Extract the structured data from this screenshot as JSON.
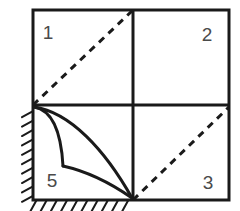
{
  "figure": {
    "canvas": {
      "width": 240,
      "height": 211
    },
    "background_color": "#ffffff",
    "stroke_color": "#1a1a1a",
    "label_color": "#4a4a4a",
    "frame": {
      "name": "outer-square-frame",
      "left": 33,
      "top": 10,
      "right": 229,
      "bottom": 200,
      "stroke_width": 3
    },
    "center": {
      "x": 133,
      "y": 105
    },
    "grid_lines": [
      {
        "name": "vertical-divider",
        "x1": 133,
        "y1": 10,
        "x2": 133,
        "y2": 200,
        "stroke_width": 3
      },
      {
        "name": "horizontal-divider",
        "x1": 33,
        "y1": 105,
        "x2": 229,
        "y2": 105,
        "stroke_width": 3
      }
    ],
    "dashed_diagonals": [
      {
        "name": "dashed-diagonal-upper-left",
        "x1": 33,
        "y1": 105,
        "x2": 133,
        "y2": 10,
        "stroke_width": 3,
        "dash_pattern": "7 6"
      },
      {
        "name": "dashed-diagonal-lower-right",
        "x1": 133,
        "y1": 200,
        "x2": 229,
        "y2": 107,
        "stroke_width": 3,
        "dash_pattern": "7 6"
      }
    ],
    "curves": [
      {
        "name": "outer-curve",
        "description": "Shallow concave curve from corner node to bottom node",
        "path": "M 34 107 C 70 112 105 150 132 198",
        "stroke_width": 3
      },
      {
        "name": "inner-curve-upper-segment",
        "description": "Steep curve from corner node bending down to kink",
        "path": "M 34 107 C 52 110 61 130 63 166",
        "stroke_width": 3
      },
      {
        "name": "inner-curve-lower-segment",
        "description": "Curve from kink sweeping right to bottom node",
        "path": "M 63 166 C 90 172 112 184 132 198",
        "stroke_width": 3
      }
    ],
    "hatching": {
      "name": "fixed-support-hatching",
      "left_edge": {
        "name": "left-edge-hatching",
        "x": 33,
        "y_start": 106,
        "y_end": 200,
        "count": 10,
        "length": 11,
        "stroke_width": 2
      },
      "bottom_edge": {
        "name": "bottom-edge-hatching",
        "y": 200,
        "x_start": 31,
        "x_end": 133,
        "count": 10,
        "length": 11,
        "stroke_width": 2
      }
    },
    "region_labels": [
      {
        "name": "region-label-1",
        "text": "1",
        "x": 48,
        "y": 34
      },
      {
        "name": "region-label-2",
        "text": "2",
        "x": 207,
        "y": 36
      },
      {
        "name": "region-label-3",
        "text": "3",
        "x": 208,
        "y": 184
      },
      {
        "name": "region-label-5",
        "text": "5",
        "x": 52,
        "y": 182
      }
    ]
  }
}
